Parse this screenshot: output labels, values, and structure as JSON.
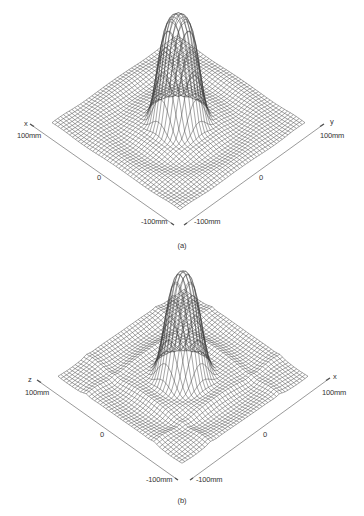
{
  "figure": {
    "panels": [
      {
        "id": "a",
        "caption": "(a)",
        "axes": {
          "left_axis_name": "x",
          "right_axis_name": "y",
          "left_max_label": "100mm",
          "right_max_label": "100mm",
          "left_mid_label": "0",
          "right_mid_label": "0",
          "left_min_label": "-100mm",
          "right_min_label": "-100mm"
        },
        "surface": {
          "description": "3D wireframe surface with a single tall rounded central peak and faint concentric ripples",
          "peak_relative_height": 1.0,
          "range_mm": [
            -100,
            100
          ]
        }
      },
      {
        "id": "b",
        "caption": "(b)",
        "axes": {
          "left_axis_name": "z",
          "right_axis_name": "x",
          "left_max_label": "100mm",
          "right_max_label": "100mm",
          "left_mid_label": "0",
          "right_mid_label": "0",
          "left_min_label": "-100mm",
          "right_min_label": "-100mm"
        },
        "surface": {
          "description": "3D wireframe surface with a single tall central peak and stronger ripple sidelobes / ridges along the edges",
          "peak_relative_height": 1.0,
          "range_mm": [
            -100,
            100
          ]
        }
      }
    ]
  },
  "colors": {
    "line": "#3a3a3a",
    "axis": "#555555",
    "background": "#ffffff"
  }
}
